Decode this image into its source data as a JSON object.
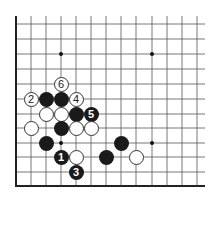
{
  "board": {
    "cols_x": [
      16,
      31,
      46,
      61,
      76,
      91,
      106,
      121,
      136,
      152,
      167,
      182,
      197
    ],
    "rows_y": [
      24,
      39,
      54,
      69,
      84,
      99,
      114,
      128,
      143,
      157,
      172,
      186
    ],
    "left_edge_x": 16,
    "bottom_edge_y": 186,
    "right_extent_x": 205,
    "top_extent_y": 16,
    "line_color": "#555555",
    "edge_color": "#222222",
    "star_points": [
      [
        61,
        54
      ],
      [
        152,
        54
      ],
      [
        61,
        143
      ],
      [
        152,
        143
      ]
    ]
  },
  "stones": [
    {
      "color": "white",
      "x": 61,
      "y": 84,
      "label": "6"
    },
    {
      "color": "white",
      "x": 31,
      "y": 99,
      "label": "2"
    },
    {
      "color": "black",
      "x": 46,
      "y": 99,
      "label": ""
    },
    {
      "color": "black",
      "x": 61,
      "y": 99,
      "label": ""
    },
    {
      "color": "white",
      "x": 76,
      "y": 99,
      "label": "4"
    },
    {
      "color": "white",
      "x": 46,
      "y": 114,
      "label": ""
    },
    {
      "color": "white",
      "x": 61,
      "y": 114,
      "label": ""
    },
    {
      "color": "black",
      "x": 76,
      "y": 114,
      "label": ""
    },
    {
      "color": "black",
      "x": 91,
      "y": 114,
      "label": "5"
    },
    {
      "color": "white",
      "x": 31,
      "y": 128,
      "label": ""
    },
    {
      "color": "black",
      "x": 61,
      "y": 128,
      "label": ""
    },
    {
      "color": "white",
      "x": 76,
      "y": 128,
      "label": ""
    },
    {
      "color": "white",
      "x": 91,
      "y": 128,
      "label": ""
    },
    {
      "color": "black",
      "x": 46,
      "y": 143,
      "label": ""
    },
    {
      "color": "black",
      "x": 121,
      "y": 143,
      "label": ""
    },
    {
      "color": "black",
      "x": 61,
      "y": 157,
      "label": "1"
    },
    {
      "color": "white",
      "x": 76,
      "y": 157,
      "label": ""
    },
    {
      "color": "black",
      "x": 106,
      "y": 157,
      "label": ""
    },
    {
      "color": "white",
      "x": 136,
      "y": 157,
      "label": ""
    },
    {
      "color": "black",
      "x": 76,
      "y": 172,
      "label": "3"
    }
  ]
}
